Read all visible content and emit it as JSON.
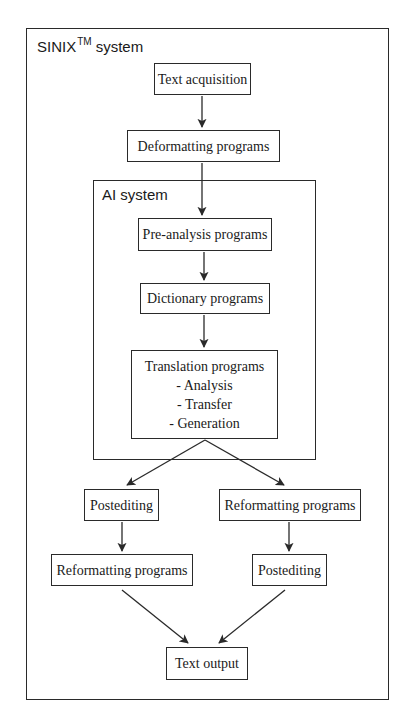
{
  "diagram": {
    "outer_system": {
      "label": "SINIX",
      "trademark": "TM",
      "label_suffix": "system"
    },
    "inner_system": {
      "label": "AI system"
    },
    "nodes": {
      "text_acquisition": "Text acquisition",
      "deformatting": "Deformatting programs",
      "pre_analysis": "Pre-analysis programs",
      "dictionary": "Dictionary programs",
      "translation": {
        "title": "Translation programs",
        "items": [
          "- Analysis",
          "- Transfer",
          "- Generation"
        ]
      },
      "postediting_left": "Postediting",
      "reformatting_right": "Reformatting programs",
      "reformatting_left": "Reformatting programs",
      "postediting_right": "Postediting",
      "text_output": "Text output"
    },
    "edges": [
      {
        "from": "Text acquisition",
        "to": "Deformatting programs"
      },
      {
        "from": "Deformatting programs",
        "to": "Pre-analysis programs"
      },
      {
        "from": "Pre-analysis programs",
        "to": "Dictionary programs"
      },
      {
        "from": "Dictionary programs",
        "to": "Translation programs"
      },
      {
        "from": "Translation programs",
        "to": "Postediting (left)"
      },
      {
        "from": "Translation programs",
        "to": "Reformatting programs (right)"
      },
      {
        "from": "Postediting (left)",
        "to": "Reformatting programs (left)"
      },
      {
        "from": "Reformatting programs (right)",
        "to": "Postediting (right)"
      },
      {
        "from": "Reformatting programs (left)",
        "to": "Text output"
      },
      {
        "from": "Postediting (right)",
        "to": "Text output"
      }
    ]
  }
}
